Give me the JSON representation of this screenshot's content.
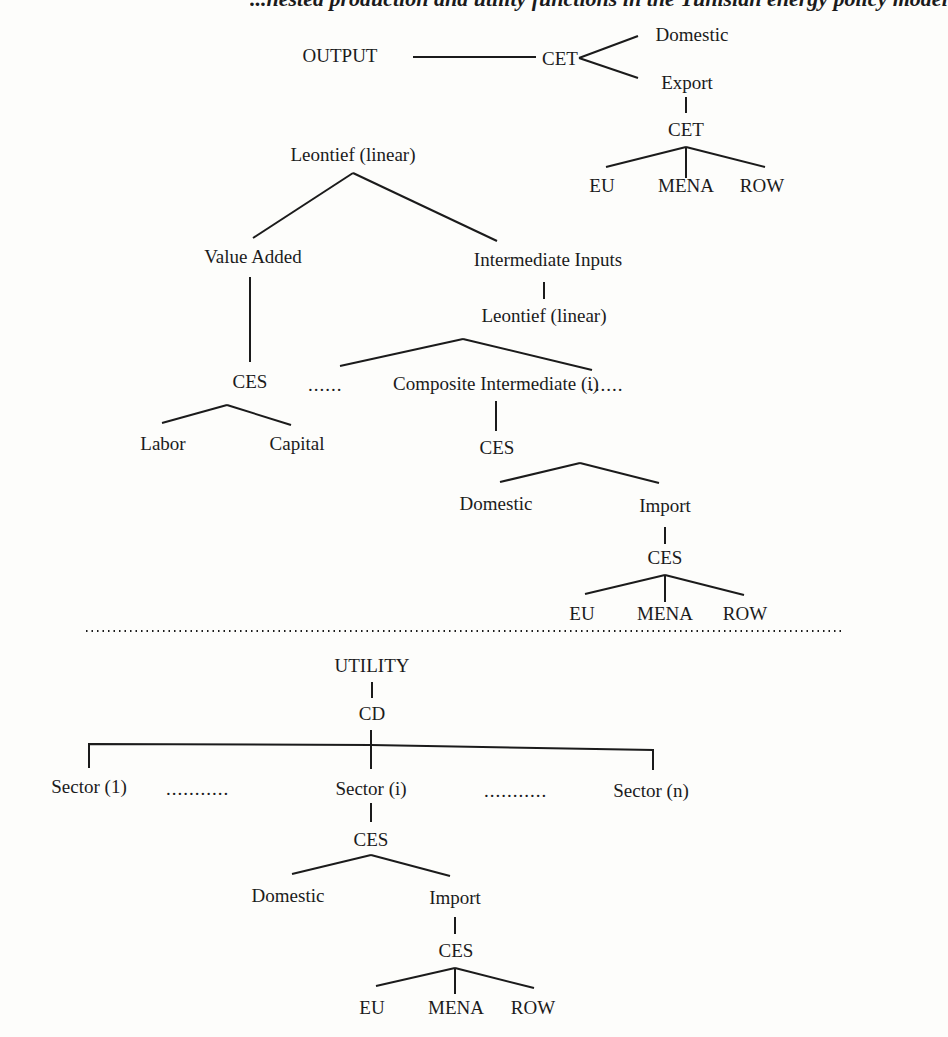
{
  "header": {
    "text": "...nested production and utility functions in the Tunisian energy policy model"
  },
  "production_block": {
    "output_tree": {
      "root": "OUTPUT",
      "cet": "CET",
      "domestic": "Domestic",
      "export": "Export",
      "export_cet": "CET",
      "export_regions": [
        "EU",
        "MENA",
        "ROW"
      ]
    },
    "input_tree": {
      "root": "Leontief (linear)",
      "value_added": "Value Added",
      "va_ces": "CES",
      "labor": "Labor",
      "capital": "Capital",
      "intermediate_inputs": "Intermediate Inputs",
      "ii_leontief": "Leontief (linear)",
      "composite": "Composite Intermediate (i)",
      "ellipsis_left": "......",
      "ellipsis_right": "......",
      "composite_ces": "CES",
      "domestic": "Domestic",
      "import": "Import",
      "import_ces": "CES",
      "import_regions": [
        "EU",
        "MENA",
        "ROW"
      ]
    }
  },
  "utility_block": {
    "root": "UTILITY",
    "cd": "CD",
    "sectors": [
      "Sector (1)",
      "Sector (i)",
      "Sector (n)"
    ],
    "ellipsis_left": "...........",
    "ellipsis_right": "...........",
    "sector_ces": "CES",
    "domestic": "Domestic",
    "import": "Import",
    "import_ces": "CES",
    "import_regions": [
      "EU",
      "MENA",
      "ROW"
    ]
  }
}
